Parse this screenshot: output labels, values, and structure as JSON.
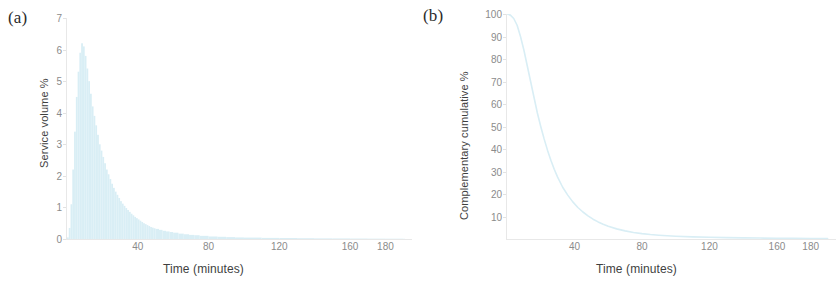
{
  "figure": {
    "background": "#ffffff",
    "data_color": "#d9eef5",
    "tick_color": "#8b8b8b",
    "axis_color": "#e8e8e8",
    "label_color": "#2b2b2b"
  },
  "panels": {
    "a": {
      "label": "(a)",
      "ylabel": "Service volume %",
      "xlabel": "Time (minutes)",
      "yticks": [
        "0",
        "1",
        "2",
        "3",
        "4",
        "5",
        "6",
        "7"
      ],
      "xticks": [
        "40",
        "80",
        "120",
        "160",
        "180"
      ]
    },
    "b": {
      "label": "(b)",
      "ylabel": "Complementary cumulative %",
      "xlabel": "Time (minutes)",
      "yticks": [
        "10",
        "20",
        "30",
        "40",
        "50",
        "60",
        "70",
        "80",
        "90",
        "100"
      ],
      "xticks": [
        "40",
        "80",
        "120",
        "160",
        "180"
      ]
    }
  },
  "chart_data": [
    {
      "type": "bar",
      "panel": "(a)",
      "title": "Service volume % vs Time",
      "xlabel": "Time (minutes)",
      "ylabel": "Service volume %",
      "xlim": [
        0,
        195
      ],
      "ylim": [
        0,
        7
      ],
      "xticks": [
        40,
        80,
        120,
        160,
        180
      ],
      "yticks": [
        0,
        1,
        2,
        3,
        4,
        5,
        6,
        7
      ],
      "grid": false,
      "legend": "none",
      "series_color": "#d9eef5",
      "bin_width": 1,
      "x": [
        0,
        1,
        2,
        3,
        4,
        5,
        6,
        7,
        8,
        9,
        10,
        11,
        12,
        13,
        14,
        15,
        16,
        17,
        18,
        19,
        20,
        21,
        22,
        23,
        24,
        25,
        26,
        27,
        28,
        29,
        30,
        31,
        32,
        33,
        34,
        35,
        36,
        37,
        38,
        39,
        40,
        41,
        42,
        43,
        44,
        45,
        46,
        47,
        48,
        49,
        50,
        52,
        54,
        56,
        58,
        60,
        63,
        66,
        69,
        72,
        75,
        80,
        85,
        90,
        95,
        100,
        110,
        120,
        130,
        140,
        150,
        160,
        170,
        180,
        190
      ],
      "values": [
        0.05,
        0.35,
        1.1,
        2.2,
        3.4,
        4.5,
        5.3,
        5.9,
        6.2,
        6.1,
        5.8,
        5.4,
        5.0,
        4.6,
        4.2,
        3.9,
        3.6,
        3.3,
        3.0,
        2.8,
        2.6,
        2.4,
        2.2,
        2.05,
        1.9,
        1.75,
        1.62,
        1.5,
        1.4,
        1.3,
        1.2,
        1.12,
        1.05,
        0.98,
        0.92,
        0.86,
        0.8,
        0.75,
        0.7,
        0.66,
        0.62,
        0.58,
        0.54,
        0.5,
        0.47,
        0.44,
        0.41,
        0.38,
        0.36,
        0.34,
        0.32,
        0.29,
        0.26,
        0.24,
        0.22,
        0.2,
        0.17,
        0.15,
        0.13,
        0.12,
        0.1,
        0.08,
        0.07,
        0.06,
        0.05,
        0.045,
        0.035,
        0.03,
        0.025,
        0.02,
        0.018,
        0.015,
        0.012,
        0.01,
        0.008
      ]
    },
    {
      "type": "line",
      "panel": "(b)",
      "title": "Complementary cumulative % vs Time",
      "xlabel": "Time (minutes)",
      "ylabel": "Complementary cumulative %",
      "xlim": [
        0,
        195
      ],
      "ylim": [
        0,
        100
      ],
      "xticks": [
        40,
        80,
        120,
        160,
        180
      ],
      "yticks": [
        10,
        20,
        30,
        40,
        50,
        60,
        70,
        80,
        90,
        100
      ],
      "grid": false,
      "legend": "none",
      "series_color": "#d9eef5",
      "x": [
        0,
        2,
        4,
        6,
        8,
        10,
        12,
        14,
        16,
        18,
        20,
        22,
        24,
        26,
        28,
        30,
        33,
        36,
        39,
        42,
        45,
        48,
        51,
        54,
        57,
        60,
        65,
        70,
        75,
        80,
        85,
        90,
        95,
        100,
        110,
        120,
        130,
        140,
        150,
        160,
        170,
        180,
        190
      ],
      "values": [
        100,
        99.5,
        98,
        95,
        90,
        84,
        77,
        70,
        63,
        56,
        50,
        44.5,
        39.5,
        35,
        31,
        27.5,
        23,
        19.5,
        16.5,
        14,
        12,
        10.3,
        8.8,
        7.6,
        6.6,
        5.7,
        4.5,
        3.6,
        2.9,
        2.4,
        2.0,
        1.7,
        1.45,
        1.25,
        0.95,
        0.75,
        0.6,
        0.5,
        0.42,
        0.35,
        0.3,
        0.25,
        0.2
      ]
    }
  ]
}
